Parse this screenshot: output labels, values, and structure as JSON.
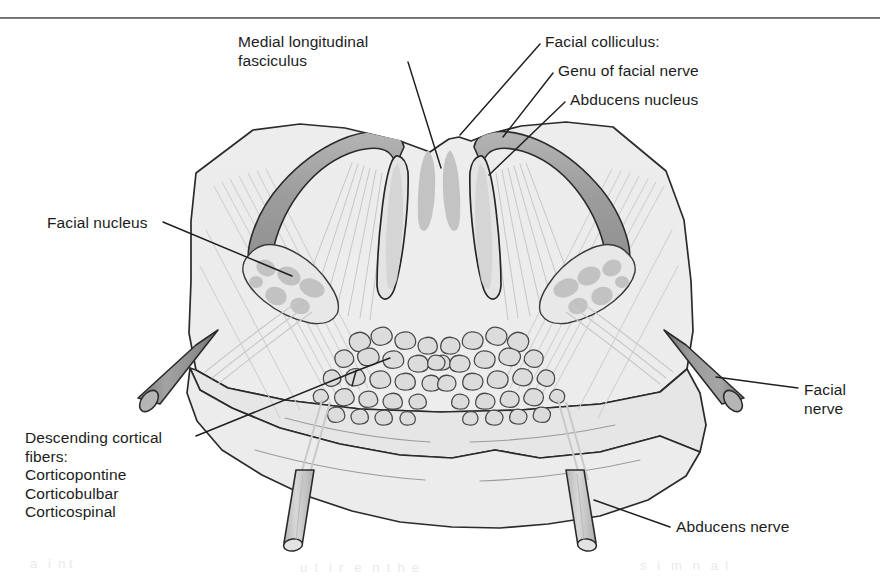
{
  "figure": {
    "domain": "anatomical line diagram",
    "rule_divider": "horizontal-rule-top"
  },
  "labels": {
    "medial_longitudinal_fasciculus": "Medial longitudinal\nfasciculus",
    "facial_colliculus_heading": "Facial colliculus:",
    "genu_of_facial_nerve": "Genu of facial nerve",
    "abducens_nucleus": "Abducens nucleus",
    "facial_nucleus": "Facial nucleus",
    "facial_nerve": "Facial\nnerve",
    "descending_cortical_fibers": "Descending cortical\nfibers:\nCorticopontine\nCorticobulbar\nCorticospinal",
    "abducens_nerve": "Abducens nerve"
  },
  "label_list": [
    {
      "id": "medial-longitudinal-fasciculus",
      "text": "Medial longitudinal fasciculus",
      "side": "top-left"
    },
    {
      "id": "facial-colliculus",
      "text": "Facial colliculus:",
      "side": "top-right"
    },
    {
      "id": "genu-of-facial-nerve",
      "text": "Genu of facial nerve",
      "side": "top-right"
    },
    {
      "id": "abducens-nucleus",
      "text": "Abducens nucleus",
      "side": "top-right"
    },
    {
      "id": "facial-nucleus",
      "text": "Facial nucleus",
      "side": "left"
    },
    {
      "id": "facial-nerve",
      "text": "Facial nerve",
      "side": "right"
    },
    {
      "id": "descending-cortical-fibers",
      "text": "Descending cortical fibers: Corticopontine Corticobulbar Corticospinal",
      "side": "bottom-left"
    },
    {
      "id": "abducens-nerve",
      "text": "Abducens nerve",
      "side": "bottom-right"
    }
  ],
  "structures": [
    {
      "id": "pons-outline",
      "name": "Pons cross-section outline"
    },
    {
      "id": "genu-band-left",
      "name": "Genu of facial nerve (left)"
    },
    {
      "id": "genu-band-right",
      "name": "Genu of facial nerve (right)"
    },
    {
      "id": "abducens-nucleus-left",
      "name": "Abducens nucleus (left)"
    },
    {
      "id": "abducens-nucleus-right",
      "name": "Abducens nucleus (right)"
    },
    {
      "id": "mlf-left",
      "name": "Medial longitudinal fasciculus (left)"
    },
    {
      "id": "mlf-right",
      "name": "Medial longitudinal fasciculus (right)"
    },
    {
      "id": "facial-nucleus-left",
      "name": "Facial nucleus (left)"
    },
    {
      "id": "facial-nucleus-right",
      "name": "Facial nucleus (right)"
    },
    {
      "id": "descending-fiber-bundle-left",
      "name": "Descending cortical fiber bundle (left)"
    },
    {
      "id": "descending-fiber-bundle-right",
      "name": "Descending cortical fiber bundle (right)"
    },
    {
      "id": "facial-nerve-root-left",
      "name": "Facial nerve root (left)"
    },
    {
      "id": "facial-nerve-root-right",
      "name": "Facial nerve root (right)"
    },
    {
      "id": "abducens-nerve-root-left",
      "name": "Abducens nerve root (left)"
    },
    {
      "id": "abducens-nerve-root-right",
      "name": "Abducens nerve root (right)"
    }
  ],
  "colors": {
    "background": "#ffffff",
    "ink": "#1a1a1a",
    "outline_stroke": "#2b2b2b",
    "tissue_fill": "#ededed",
    "tissue_fill_dark": "#e2e2e2",
    "nucleus_gray": "#c2c2c2",
    "genu_gray": "#a9a9a9",
    "nerve_gray": "#9a9a9a",
    "fiber_outline": "#555555",
    "fiber_fill": "#dcdcdc",
    "leader_line": "#1f1f1f",
    "ghost_text": "#e9e9ec"
  },
  "ghost_text": {
    "line1": "a   i  n t",
    "line2": "u  t   i  r   e   n  t  h  e",
    "line3": "s   i   m   n   a  l"
  }
}
